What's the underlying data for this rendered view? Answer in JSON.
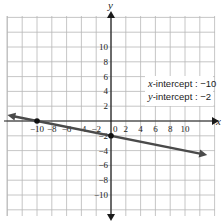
{
  "chart_data": {
    "type": "line",
    "title": "",
    "xlabel": "x",
    "ylabel": "y",
    "xlim": [
      -14,
      14
    ],
    "ylim": [
      -12,
      14
    ],
    "grid": true,
    "grid_step": 2,
    "x_ticks": [
      -10,
      -8,
      -6,
      -4,
      -2,
      2,
      4,
      6,
      8,
      10
    ],
    "y_ticks": [
      10,
      8,
      6,
      4,
      2,
      -2,
      -4,
      -6,
      -8,
      -10
    ],
    "origin_label": "0",
    "series": [
      {
        "name": "line",
        "equation": "y = -x/5 - 2",
        "slope": -0.2,
        "intercept": -2,
        "x": [
          -14,
          13
        ],
        "y": [
          0.8,
          -4.6
        ],
        "color": "#4a4a4a"
      }
    ],
    "points": [
      {
        "label": "x-intercept",
        "x": -10,
        "y": 0
      },
      {
        "label": "y-intercept",
        "x": 0,
        "y": -2
      }
    ],
    "annotations": [
      {
        "text_var": "x",
        "text": "-intercept : −10"
      },
      {
        "text_var": "y",
        "text": "-intercept : −2"
      }
    ]
  },
  "colors": {
    "grid": "#b8b8b8",
    "axis": "#1a1a1a",
    "line": "#4a4a4a",
    "point": "#111111"
  }
}
